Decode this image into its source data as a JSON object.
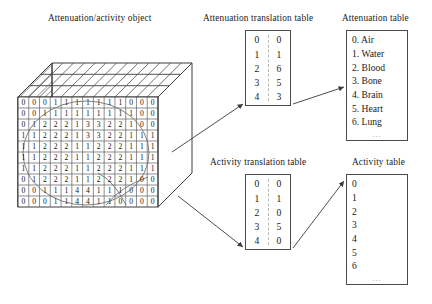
{
  "figure": {
    "object_title": "Attenuation/activity object",
    "attenuation_translation_title": "Attenuation translation table",
    "attenuation_table_title": "Attenuation table",
    "activity_translation_title": "Activity translation table",
    "activity_table_title": "Activity table",
    "ellipsis": "..."
  },
  "object_grid": {
    "rows": 11,
    "cols": 13,
    "values": [
      [
        "0",
        "0",
        "0",
        "1",
        "1",
        "1",
        "1",
        "1",
        "1",
        "1",
        "0",
        "0",
        "0"
      ],
      [
        "0",
        "0",
        "1",
        "1",
        "1",
        "1",
        "1",
        "1",
        "1",
        "1",
        "1",
        "0",
        "0"
      ],
      [
        "0",
        "1",
        "2",
        "2",
        "2",
        "1",
        "3",
        "3",
        "2",
        "2",
        "1",
        "0",
        "0"
      ],
      [
        "1",
        "1",
        "2",
        "2",
        "2",
        "1",
        "3",
        "3",
        "2",
        "2",
        "1",
        "1",
        "1"
      ],
      [
        "1",
        "1",
        "2",
        "2",
        "2",
        "1",
        "1",
        "2",
        "2",
        "2",
        "1",
        "1",
        "1"
      ],
      [
        "1",
        "1",
        "2",
        "2",
        "2",
        "1",
        "1",
        "2",
        "2",
        "2",
        "1",
        "1",
        "1"
      ],
      [
        "1",
        "1",
        "2",
        "2",
        "2",
        "1",
        "1",
        "2",
        "2",
        "2",
        "1",
        "1",
        "1"
      ],
      [
        "0",
        "1",
        "2",
        "2",
        "2",
        "1",
        "1",
        "2",
        "2",
        "2",
        "1",
        "0",
        "0"
      ],
      [
        "0",
        "0",
        "1",
        "1",
        "1",
        "4",
        "4",
        "1",
        "1",
        "1",
        "0",
        "0",
        "0"
      ],
      [
        "0",
        "0",
        "0",
        "1",
        "1",
        "4",
        "4",
        "1",
        "1",
        "0",
        "0",
        "0",
        "0"
      ]
    ]
  },
  "attenuation_translation": {
    "columns": [
      "index",
      "value"
    ],
    "rows": [
      {
        "index": "0",
        "value": "0"
      },
      {
        "index": "1",
        "value": "1"
      },
      {
        "index": "2",
        "value": "6"
      },
      {
        "index": "3",
        "value": "5"
      },
      {
        "index": "4",
        "value": "3"
      }
    ]
  },
  "attenuation_materials": {
    "entries": [
      "0. Air",
      "1. Water",
      "2. Blood",
      "3. Bone",
      "4. Brain",
      "5. Heart",
      "6. Lung"
    ],
    "more": "..."
  },
  "activity_translation": {
    "columns": [
      "index",
      "value"
    ],
    "rows": [
      {
        "index": "0",
        "value": "0"
      },
      {
        "index": "1",
        "value": "1"
      },
      {
        "index": "2",
        "value": "0"
      },
      {
        "index": "3",
        "value": "5"
      },
      {
        "index": "4",
        "value": "0"
      }
    ]
  },
  "activity_values": {
    "entries": [
      "0",
      "1",
      "2",
      "3",
      "4",
      "5",
      "6"
    ],
    "more": "..."
  },
  "colors": {
    "ink": "#1a1a1a",
    "line": "#4a4a4a",
    "hatch": "#555555",
    "dashed": "#b9b9b9",
    "background": "#ffffff"
  }
}
